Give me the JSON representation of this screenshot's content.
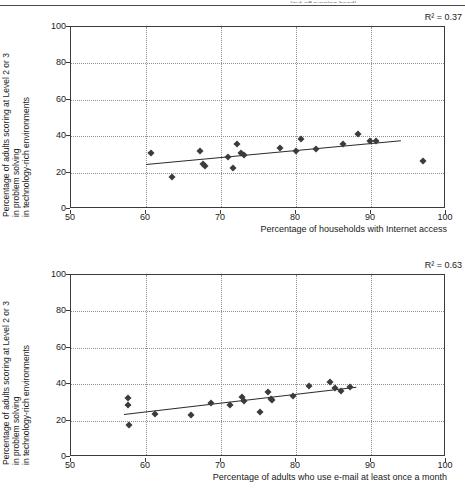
{
  "page": {
    "header_sliver_text": "(cut-off running head)"
  },
  "charts": [
    {
      "id": "chart-1",
      "r2_prefix": "R",
      "r2_sup": "2",
      "r2_text": "R² = 0.37",
      "r2_value": 0.37,
      "xlabel": "Percentage of households with Internet access",
      "ylabel_lines": [
        "Percentage of adults scoring at Level 2 or 3",
        "in problem solving",
        "in technology-rich environments"
      ],
      "xticks": [
        "50",
        "60",
        "70",
        "80",
        "90",
        "100"
      ],
      "yticks": [
        "0",
        "20",
        "40",
        "60",
        "80",
        "100"
      ]
    },
    {
      "id": "chart-2",
      "r2_prefix": "R",
      "r2_sup": "2",
      "r2_text": "R² = 0.63",
      "r2_value": 0.63,
      "xlabel": "Percentage of adults who use e-mail at least once a month",
      "ylabel_lines": [
        "Percentage of adults scoring at Level 2 or 3",
        "in problem solving",
        "in technology-rich environments"
      ],
      "xticks": [
        "50",
        "60",
        "70",
        "80",
        "90",
        "100"
      ],
      "yticks": [
        "0",
        "20",
        "40",
        "60",
        "80",
        "100"
      ]
    }
  ],
  "chart_data": [
    {
      "type": "scatter",
      "title": "",
      "xlabel": "Percentage of households with Internet access",
      "ylabel": "Percentage of adults scoring at Level 2 or 3 in problem solving in technology-rich environments",
      "xlim": [
        50,
        100
      ],
      "ylim": [
        0,
        100
      ],
      "xticks": [
        50,
        60,
        70,
        80,
        90,
        100
      ],
      "yticks": [
        0,
        20,
        40,
        60,
        80,
        100
      ],
      "grid": true,
      "legend": "none",
      "annotations": [
        "R² = 0.37"
      ],
      "r_squared": 0.37,
      "points": [
        {
          "x": 60.6,
          "y": 31.0
        },
        {
          "x": 63.4,
          "y": 17.5
        },
        {
          "x": 67.2,
          "y": 32.0
        },
        {
          "x": 67.6,
          "y": 24.5
        },
        {
          "x": 67.9,
          "y": 23.5
        },
        {
          "x": 70.9,
          "y": 28.5
        },
        {
          "x": 71.6,
          "y": 22.5
        },
        {
          "x": 72.1,
          "y": 35.5
        },
        {
          "x": 72.6,
          "y": 30.5
        },
        {
          "x": 73.0,
          "y": 29.5
        },
        {
          "x": 77.9,
          "y": 33.5
        },
        {
          "x": 80.0,
          "y": 32.0
        },
        {
          "x": 80.6,
          "y": 38.5
        },
        {
          "x": 82.6,
          "y": 33.0
        },
        {
          "x": 86.2,
          "y": 35.5
        },
        {
          "x": 88.2,
          "y": 41.0
        },
        {
          "x": 89.8,
          "y": 37.5
        },
        {
          "x": 90.7,
          "y": 37.5
        },
        {
          "x": 96.9,
          "y": 26.5
        }
      ],
      "trendline": {
        "x0": 60.0,
        "y0": 25.0,
        "x1": 94.0,
        "y1": 38.0
      }
    },
    {
      "type": "scatter",
      "title": "",
      "xlabel": "Percentage of adults who use e-mail at least once a month",
      "ylabel": "Percentage of adults scoring at Level 2 or 3 in problem solving in technology-rich environments",
      "xlim": [
        50,
        100
      ],
      "ylim": [
        0,
        100
      ],
      "xticks": [
        50,
        60,
        70,
        80,
        90,
        100
      ],
      "yticks": [
        0,
        20,
        40,
        60,
        80,
        100
      ],
      "grid": true,
      "legend": "none",
      "annotations": [
        "R² = 0.63"
      ],
      "r_squared": 0.63,
      "points": [
        {
          "x": 57.6,
          "y": 32.5
        },
        {
          "x": 57.6,
          "y": 28.5
        },
        {
          "x": 57.7,
          "y": 17.5
        },
        {
          "x": 61.2,
          "y": 23.5
        },
        {
          "x": 66.0,
          "y": 23.0
        },
        {
          "x": 68.6,
          "y": 29.5
        },
        {
          "x": 71.2,
          "y": 28.5
        },
        {
          "x": 72.8,
          "y": 33.0
        },
        {
          "x": 73.0,
          "y": 31.0
        },
        {
          "x": 75.2,
          "y": 24.5
        },
        {
          "x": 76.2,
          "y": 35.5
        },
        {
          "x": 76.6,
          "y": 32.0
        },
        {
          "x": 76.8,
          "y": 31.5
        },
        {
          "x": 79.6,
          "y": 33.5
        },
        {
          "x": 81.7,
          "y": 39.0
        },
        {
          "x": 84.5,
          "y": 41.0
        },
        {
          "x": 85.2,
          "y": 38.0
        },
        {
          "x": 86.0,
          "y": 36.0
        },
        {
          "x": 87.2,
          "y": 38.5
        }
      ],
      "trendline": {
        "x0": 57.0,
        "y0": 23.5,
        "x1": 88.0,
        "y1": 38.5
      }
    }
  ]
}
